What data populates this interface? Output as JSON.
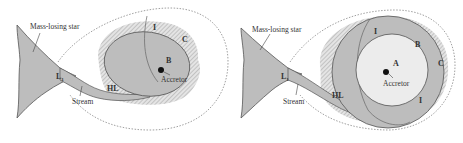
{
  "panels": [
    {
      "id": "left",
      "labels": {
        "star": "Mass-losing star",
        "l1": "L",
        "l1_sub": "1",
        "stream": "Stream",
        "hl": "HL",
        "region_i": "I",
        "region_b": "B",
        "region_c": "C",
        "accretor": "Accretor"
      }
    },
    {
      "id": "right",
      "labels": {
        "star": "Mass-losing star",
        "l1": "L",
        "l1_sub": "1",
        "stream": "Stream",
        "hl": "HL",
        "region_i_top": "I",
        "region_i_bottom": "I",
        "region_a": "A",
        "region_b": "B",
        "region_c": "C",
        "accretor": "Accretor"
      }
    }
  ],
  "colors": {
    "fill_gray": "#bdbdbd",
    "fill_light": "#e6e6e6",
    "stroke": "#555555",
    "hatch": "#9a9a9a"
  }
}
